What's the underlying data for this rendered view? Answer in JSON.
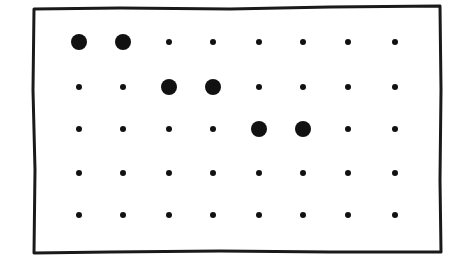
{
  "diagram": {
    "type": "dot-grid",
    "frame": {
      "x": 34,
      "y": 8,
      "width": 406,
      "height": 244,
      "stroke": "#1a1a1a",
      "stroke_width": 3
    },
    "columns_x": [
      79,
      123,
      169,
      213,
      259,
      303,
      348,
      395
    ],
    "rows_y": [
      42,
      87,
      129,
      173,
      215
    ],
    "dot_color": "#111111",
    "small_radius": 3,
    "large_radius": 8,
    "large_dots": [
      {
        "row": 0,
        "col": 0
      },
      {
        "row": 0,
        "col": 1
      },
      {
        "row": 1,
        "col": 2
      },
      {
        "row": 1,
        "col": 3
      },
      {
        "row": 2,
        "col": 4
      },
      {
        "row": 2,
        "col": 5
      }
    ]
  }
}
